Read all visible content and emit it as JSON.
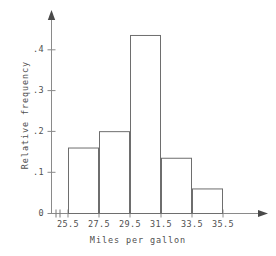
{
  "chart_data": {
    "type": "bar",
    "title": "",
    "subtitle": "",
    "xlabel": "Miles per gallon",
    "ylabel": "Relative frequency",
    "categories": [
      "25.5-27.5",
      "27.5-29.5",
      "29.5-31.5",
      "31.5-33.5",
      "33.5-35.5"
    ],
    "bin_edges": [
      25.5,
      27.5,
      29.5,
      31.5,
      33.5,
      35.5
    ],
    "values": [
      0.16,
      0.2,
      0.435,
      0.135,
      0.06
    ],
    "xtick_labels": [
      "25.5",
      "27.5",
      "29.5",
      "31.5",
      "33.5",
      "35.5"
    ],
    "ytick_labels": [
      "0",
      ".1",
      ".2",
      ".3",
      ".4"
    ],
    "ytick_values": [
      0,
      0.1,
      0.2,
      0.3,
      0.4
    ],
    "xlim": [
      25.5,
      35.5
    ],
    "ylim": [
      0,
      0.48
    ],
    "grid": false,
    "legend": null,
    "bar_fill": "#ffffff",
    "bar_stroke": "#6e6e6e",
    "axis_color": "#8a8a8a",
    "text_color": "#4f4f4f",
    "background": "#ffffff",
    "axis_has_arrowheads": true,
    "x_axis_break_mark": true,
    "annotations": []
  }
}
